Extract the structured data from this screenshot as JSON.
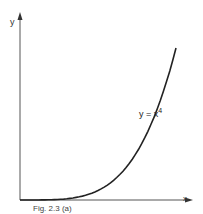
{
  "chart_data": {
    "type": "line",
    "title": "",
    "xlabel": "x",
    "ylabel": "y",
    "grid": false,
    "legend": null,
    "annotations": [
      {
        "text": "y = x^4",
        "position": "right of curve, mid-height"
      }
    ],
    "series": [
      {
        "name": "y = x^4",
        "x": [
          0,
          0.1,
          0.2,
          0.3,
          0.4,
          0.5,
          0.6,
          0.7,
          0.8,
          0.9,
          1.0
        ],
        "y": [
          0,
          0.0001,
          0.0016,
          0.0081,
          0.0256,
          0.0625,
          0.1296,
          0.2401,
          0.4096,
          0.6561,
          1.0
        ]
      }
    ],
    "xlim": [
      0,
      1.25
    ],
    "ylim": [
      0,
      1.15
    ]
  },
  "labels": {
    "y_axis": "y",
    "x_axis": "x",
    "equation_base": "y = x",
    "equation_exp": "4",
    "caption": "Fig. 2.3 (a)"
  }
}
